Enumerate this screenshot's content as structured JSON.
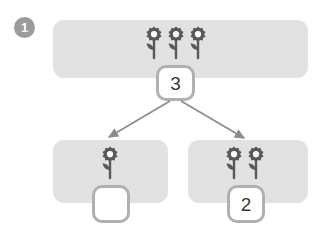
{
  "exercise": {
    "step_number": "1",
    "icon_name": "flower-icon"
  },
  "whole_group": {
    "flower_count": 3,
    "panel_label": "whole-group-panel",
    "number_box": {
      "value": "3",
      "filled": true
    }
  },
  "part_groups": [
    {
      "flower_count": 1,
      "panel_label": "part-group-left-panel",
      "number_box": {
        "value": "",
        "filled": false
      }
    },
    {
      "flower_count": 2,
      "panel_label": "part-group-right-panel",
      "number_box": {
        "value": "2",
        "filled": true
      }
    }
  ],
  "arrows": [
    {
      "name": "arrow-to-left-part",
      "x1": 170,
      "y1": 101,
      "x2": 108,
      "y2": 138
    },
    {
      "name": "arrow-to-right-part",
      "x1": 181,
      "y1": 101,
      "x2": 245,
      "y2": 139
    }
  ],
  "colors": {
    "panel_fill": "#e2e2e2",
    "badge_fill": "#9b9b9b",
    "badge_text": "#ffffff",
    "box_border": "#b0b0b0",
    "box_fill": "#ffffff",
    "number_text": "#3a3a3a",
    "flower_dark": "#595959",
    "flower_center": "#ffffff",
    "arrow": "#8c8c8c",
    "background": "#ffffff"
  }
}
